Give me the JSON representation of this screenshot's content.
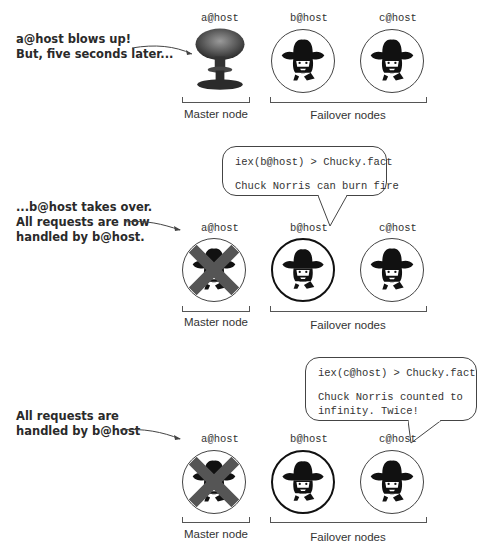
{
  "panels": [
    {
      "caption": "a@host blows up!\nBut, five seconds later...",
      "nodes": [
        {
          "host": "a@host",
          "state": "exploded",
          "icon": "mushroom-cloud-icon"
        },
        {
          "host": "b@host",
          "state": "standby",
          "icon": "chuck-norris-icon"
        },
        {
          "host": "c@host",
          "state": "standby",
          "icon": "chuck-norris-icon"
        }
      ],
      "groups": {
        "master": "Master node",
        "failover": "Failover nodes"
      }
    },
    {
      "caption": "...b@host takes over.\nAll requests are now\nhandled by b@host.",
      "bubble": {
        "prompt": "iex(b@host) > Chucky.fact",
        "output": "Chuck Norris can burn fire"
      },
      "nodes": [
        {
          "host": "a@host",
          "state": "dead",
          "icon": "x-cross-icon"
        },
        {
          "host": "b@host",
          "state": "active",
          "icon": "chuck-norris-icon"
        },
        {
          "host": "c@host",
          "state": "standby",
          "icon": "chuck-norris-icon"
        }
      ],
      "groups": {
        "master": "Master node",
        "failover": "Failover nodes"
      }
    },
    {
      "caption": "All requests are\nhandled by b@host",
      "bubble": {
        "prompt": "iex(c@host) > Chucky.fact",
        "output": "Chuck Norris counted to\ninfinity. Twice!"
      },
      "nodes": [
        {
          "host": "a@host",
          "state": "dead",
          "icon": "x-cross-icon"
        },
        {
          "host": "b@host",
          "state": "active",
          "icon": "chuck-norris-icon"
        },
        {
          "host": "c@host",
          "state": "standby",
          "icon": "chuck-norris-icon"
        }
      ],
      "groups": {
        "master": "Master node",
        "failover": "Failover nodes"
      }
    }
  ],
  "colors": {
    "line": "#444444",
    "cross": "#555555",
    "text": "#222222"
  }
}
